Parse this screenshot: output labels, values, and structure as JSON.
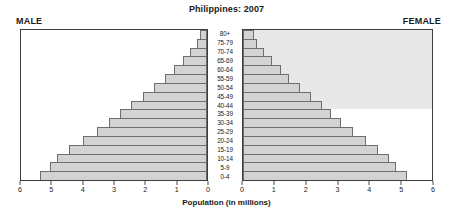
{
  "chart": {
    "title": "Philippines: 2007",
    "male_caption": "MALE",
    "female_caption": "FEMALE",
    "xlabel": "Population (in millions)"
  },
  "chart_data": {
    "type": "bar",
    "subtype": "population-pyramid",
    "title": "Philippines: 2007",
    "xlabel": "Population (in millions)",
    "ylabel": "",
    "grid": false,
    "legend": "none",
    "orientation": "horizontal",
    "categories": [
      "0-4",
      "5-9",
      "10-14",
      "15-19",
      "20-24",
      "25-29",
      "30-34",
      "35-39",
      "40-44",
      "45-49",
      "50-54",
      "55-59",
      "60-64",
      "65-69",
      "70-74",
      "75-79",
      "80+"
    ],
    "male_axis": {
      "label": "MALE",
      "side": "left",
      "ticks": [
        6,
        5,
        4,
        3,
        2,
        1,
        0
      ],
      "lim": [
        6,
        0
      ]
    },
    "female_axis": {
      "label": "FEMALE",
      "side": "right",
      "ticks": [
        0,
        1,
        2,
        3,
        4,
        5,
        6
      ],
      "lim": [
        0,
        6
      ]
    },
    "series": [
      {
        "name": "MALE",
        "values": [
          5.4,
          5.05,
          4.85,
          4.45,
          4.0,
          3.55,
          3.15,
          2.8,
          2.45,
          2.05,
          1.7,
          1.35,
          1.05,
          0.78,
          0.55,
          0.33,
          0.22
        ]
      },
      {
        "name": "FEMALE",
        "values": [
          5.2,
          4.85,
          4.65,
          4.3,
          3.9,
          3.5,
          3.1,
          2.8,
          2.5,
          2.15,
          1.8,
          1.45,
          1.2,
          0.92,
          0.68,
          0.44,
          0.34
        ]
      }
    ],
    "annotations": [
      {
        "type": "shaded-region",
        "panel": "FEMALE",
        "from_category": "40-44",
        "to_category": "80+",
        "color": "#e8e8e8"
      }
    ]
  },
  "colors": {
    "bar_fill": "#d3d3d3",
    "bar_stroke": "#6e6e6e",
    "panel_border": "#3c3c3c",
    "shade": "#e8e8e8",
    "text": "#1a1a1a"
  }
}
